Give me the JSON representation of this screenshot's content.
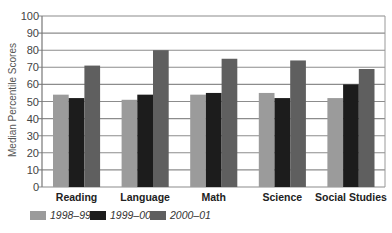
{
  "chart_data": {
    "type": "bar",
    "title": "",
    "xlabel": "",
    "ylabel": "Median Percentile Scores",
    "ylim": [
      0,
      100
    ],
    "yticks": [
      0,
      10,
      20,
      30,
      40,
      50,
      60,
      70,
      80,
      90,
      100
    ],
    "grid": true,
    "legend_position": "bottom-left",
    "categories": [
      "Reading",
      "Language",
      "Math",
      "Science",
      "Social Studies"
    ],
    "series": [
      {
        "name": "1998–99",
        "color": "#9b9b9b",
        "values": [
          54,
          51,
          54,
          55,
          52
        ]
      },
      {
        "name": "1999–00",
        "color": "#1c1c1c",
        "values": [
          52,
          54,
          55,
          52,
          60
        ]
      },
      {
        "name": "2000–01",
        "color": "#5f5f5f",
        "values": [
          71,
          80,
          75,
          74,
          69
        ]
      }
    ]
  }
}
